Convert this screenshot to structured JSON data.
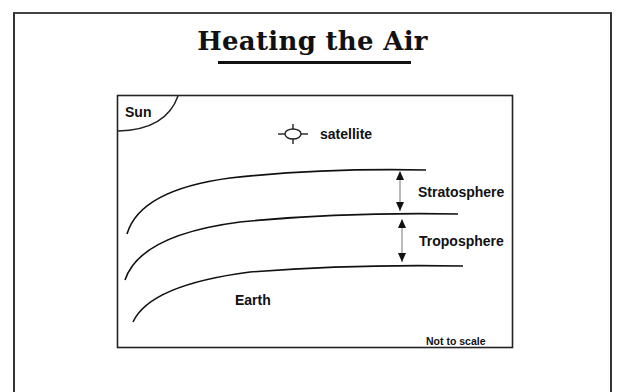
{
  "title": "Heating the Air",
  "diagram": {
    "labels": {
      "sun": "Sun",
      "satellite": "satellite",
      "stratosphere": "Stratosphere",
      "troposphere": "Troposphere",
      "earth": "Earth",
      "scale_note": "Not to scale"
    },
    "layers": [
      "Stratosphere",
      "Troposphere",
      "Earth"
    ],
    "colors": {
      "line": "#111111",
      "background": "#ffffff"
    }
  }
}
